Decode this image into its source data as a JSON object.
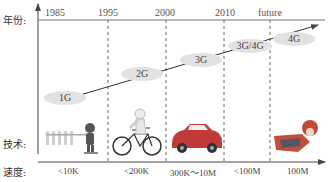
{
  "labels": {
    "year": "年份:",
    "technology": "技术:",
    "speed": "速度:"
  },
  "years": [
    "1985",
    "1995",
    "2000",
    "2010",
    "future"
  ],
  "generations": [
    "1G",
    "2G",
    "3G",
    "3G/4G",
    "4G"
  ],
  "technologies": [
    {
      "icon": "walking-people-icon",
      "speed": "<10K"
    },
    {
      "icon": "bicycle-rider-icon",
      "speed": "<200K"
    },
    {
      "icon": "car-icon",
      "speed": "300K～10M"
    },
    {
      "icon": "flying-superhero-icon",
      "speed": "<100M"
    },
    {
      "icon": "",
      "speed": "100M"
    }
  ],
  "colors": {
    "axis": "#444444",
    "dash": "#666666",
    "ellipse": "#e2e2e2",
    "car": "#c03a3a"
  }
}
